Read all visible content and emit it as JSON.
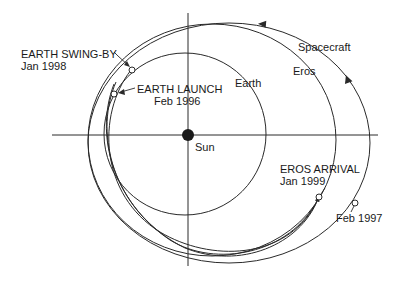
{
  "diagram": {
    "center_body": {
      "name": "Sun",
      "label": "Sun"
    },
    "orbits": [
      {
        "id": "earth",
        "label": "Earth"
      },
      {
        "id": "eros",
        "label": "Eros"
      },
      {
        "id": "spacecraft",
        "label": "Spacecraft"
      }
    ],
    "events": [
      {
        "id": "earth-swing-by",
        "title": "EARTH SWING-BY",
        "date": "Jan 1998"
      },
      {
        "id": "earth-launch",
        "title": "EARTH LAUNCH",
        "date": "Feb 1996"
      },
      {
        "id": "eros-arrival",
        "title": "EROS ARRIVAL",
        "date": "Jan 1999"
      },
      {
        "id": "feb-1997",
        "title": "",
        "date": "Feb 1997"
      }
    ],
    "colors": {
      "line": "#2a2a2a",
      "background": "#ffffff",
      "sun": "#1a1a1a"
    }
  }
}
